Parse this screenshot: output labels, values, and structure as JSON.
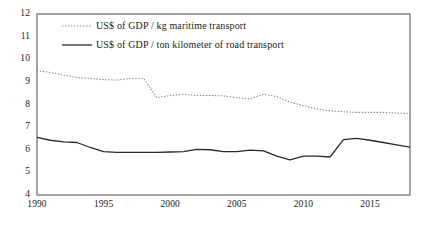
{
  "chart_data": {
    "type": "line",
    "title": "",
    "xlabel": "",
    "ylabel": "",
    "xlim": [
      1990,
      2018
    ],
    "ylim": [
      4,
      12
    ],
    "grid": false,
    "legend_position": "top-left inside plot",
    "x_ticks": [
      "1990",
      "1995",
      "2000",
      "2005",
      "2010",
      "2015"
    ],
    "x_tick_values": [
      1990,
      1995,
      2000,
      2005,
      2010,
      2015
    ],
    "y_ticks": [
      "4",
      "5",
      "6",
      "7",
      "8",
      "9",
      "10",
      "11",
      "12"
    ],
    "y_tick_values": [
      4,
      5,
      6,
      7,
      8,
      9,
      10,
      11,
      12
    ],
    "x": [
      1990,
      1991,
      1992,
      1993,
      1994,
      1995,
      1996,
      1997,
      1998,
      1999,
      2000,
      2001,
      2002,
      2003,
      2004,
      2005,
      2006,
      2007,
      2008,
      2009,
      2010,
      2011,
      2012,
      2013,
      2014,
      2015,
      2016,
      2017,
      2018
    ],
    "series": [
      {
        "name": "US$ of GDP / kg maritime transport",
        "style": "dotted",
        "color": "#8a8a8a",
        "values": [
          9.5,
          9.42,
          9.3,
          9.2,
          9.15,
          9.1,
          9.08,
          9.15,
          9.15,
          8.3,
          8.4,
          8.45,
          8.4,
          8.4,
          8.38,
          8.3,
          8.25,
          8.45,
          8.35,
          8.1,
          7.95,
          7.8,
          7.72,
          7.68,
          7.65,
          7.65,
          7.65,
          7.62,
          7.6
        ]
      },
      {
        "name": "US$ of GDP / ton kilometer of road transport",
        "style": "solid",
        "color": "#2b2b2b",
        "values": [
          6.55,
          6.42,
          6.35,
          6.32,
          6.1,
          5.92,
          5.88,
          5.88,
          5.88,
          5.88,
          5.9,
          5.92,
          6.02,
          6.0,
          5.92,
          5.92,
          5.98,
          5.95,
          5.72,
          5.55,
          5.72,
          5.72,
          5.68,
          6.45,
          6.5,
          6.42,
          6.32,
          6.22,
          6.12
        ]
      }
    ]
  },
  "legend": {
    "entries": [
      {
        "label": "US$ of GDP / kg maritime transport",
        "style": "dotted"
      },
      {
        "label": "US$ of GDP / ton kilometer of road transport",
        "style": "solid"
      }
    ]
  },
  "colors": {
    "maritime": "#8a8a8a",
    "road": "#2b2b2b",
    "axis": "#5a5a5a",
    "text": "#1a1a1a",
    "background": "#ffffff"
  }
}
